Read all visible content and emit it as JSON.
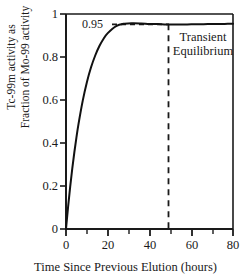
{
  "chart_data": {
    "type": "line",
    "title": "",
    "xlabel": "Time Since Previous Elution (hours)",
    "ylabel_line1": "Tc-99m activity as",
    "ylabel_line2": "Fraction of Mo-99 activity",
    "xlim": [
      0,
      80
    ],
    "ylim": [
      0,
      1
    ],
    "xticks": [
      0,
      20,
      40,
      60,
      80
    ],
    "xtick_labels": [
      "0",
      "20",
      "40",
      "60",
      "80"
    ],
    "xminor_ticks": [
      10,
      30,
      50,
      70
    ],
    "yticks": [
      0,
      0.2,
      0.4,
      0.6,
      0.8,
      1
    ],
    "ytick_labels": [
      "0",
      "0.2",
      "0.4",
      "0.6",
      "0.8",
      "1"
    ],
    "grid": false,
    "legend": null,
    "series": [
      {
        "name": "Tc-99m / Mo-99 activity ratio",
        "color": "#111111",
        "x": [
          0,
          1,
          2,
          3,
          4,
          5,
          6,
          8,
          10,
          12,
          14,
          16,
          18,
          20,
          24,
          28,
          32,
          36,
          40,
          44,
          48,
          52,
          56,
          60,
          64,
          68,
          72,
          76,
          80
        ],
        "y": [
          0.0,
          0.103,
          0.196,
          0.281,
          0.357,
          0.426,
          0.489,
          0.596,
          0.683,
          0.752,
          0.807,
          0.851,
          0.885,
          0.911,
          0.944,
          0.955,
          0.957,
          0.956,
          0.954,
          0.953,
          0.951,
          0.951,
          0.951,
          0.952,
          0.952,
          0.953,
          0.953,
          0.954,
          0.955
        ]
      }
    ],
    "annotations": [
      {
        "name": "equilibrium-value",
        "text": "0.95",
        "type": "hline-label",
        "y": 0.95,
        "x_label": 15,
        "dashed_from_x": 22,
        "dashed_to_x": 48.5
      },
      {
        "name": "transient-equilibrium-marker",
        "text_line1": "Transient",
        "text_line2": "Equilibrium",
        "type": "vline-label",
        "x": 48.5,
        "label_x": 65,
        "label_y": 0.84
      }
    ]
  },
  "axes": {
    "ytick_labels": [
      "1",
      "0.8",
      "0.6",
      "0.4",
      "0.2",
      "0"
    ],
    "xtick_labels": [
      "0",
      "20",
      "40",
      "60",
      "80"
    ],
    "xlabel": "Time Since Previous Elution (hours)",
    "ylabel_line1": "Tc-99m activity as",
    "ylabel_line2": "Fraction of Mo-99 activity"
  },
  "annotations": {
    "equilibrium_value": "0.95",
    "transient_line1": "Transient",
    "transient_line2": "Equilibrium"
  },
  "style": {
    "line_color": "#111111",
    "axis_color": "#1a1a1a",
    "background": "#ffffff"
  }
}
